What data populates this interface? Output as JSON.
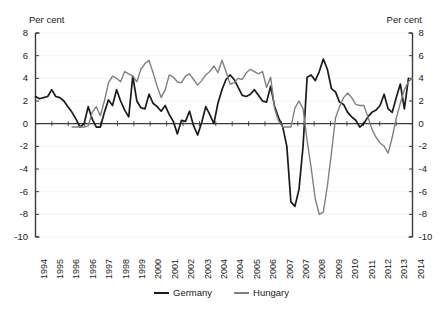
{
  "chart_data": {
    "type": "line",
    "title": "",
    "subtitle": "",
    "xlabel": "",
    "ylabel": "Per cent",
    "ylabel_right": "Per cent",
    "ylim": [
      -10,
      8
    ],
    "yticks": [
      8,
      6,
      4,
      2,
      0,
      -2,
      -4,
      -6,
      -8,
      -10
    ],
    "ytick_labels": [
      "8",
      "6",
      "4",
      "2",
      "0",
      "-2",
      "-4",
      "-6",
      "-8",
      "-10"
    ],
    "grid": true,
    "grid_axis": "y",
    "legend_position": "bottom",
    "zero_line": true,
    "dual_axis": true,
    "x_tick_labels": [
      "1994",
      "1995",
      "1996",
      "1996",
      "1997",
      "1998",
      "1999",
      "2000",
      "2001",
      "2002",
      "2003",
      "2004",
      "2004",
      "2005",
      "2006",
      "2007",
      "2007",
      "2008",
      "2009",
      "2010",
      "2011",
      "2012",
      "2013",
      "2014"
    ],
    "x_label_rotation": -90,
    "x_points_per_label": 3.6,
    "series": [
      {
        "name": "Germany",
        "color": "#1a1a1a",
        "values": [
          2.4,
          2.2,
          2.3,
          2.4,
          3.0,
          2.4,
          2.3,
          2.0,
          1.5,
          1.0,
          0.4,
          -0.3,
          0.0,
          1.5,
          0.4,
          -0.3,
          -0.3,
          1.0,
          2.1,
          1.6,
          3.0,
          2.0,
          1.2,
          0.6,
          4.2,
          2.0,
          1.4,
          1.3,
          2.6,
          1.8,
          1.5,
          1.1,
          1.6,
          0.8,
          0.2,
          -0.9,
          0.3,
          0.2,
          1.1,
          -0.2,
          -1.0,
          0.1,
          1.5,
          0.8,
          0.0,
          1.8,
          3.0,
          3.9,
          4.3,
          3.9,
          3.2,
          2.5,
          2.4,
          2.6,
          3.0,
          2.5,
          2.0,
          1.9,
          3.3,
          1.5,
          0.5,
          -0.3,
          -2.0,
          -6.9,
          -7.3,
          -5.8,
          -2.0,
          4.1,
          4.3,
          3.8,
          4.6,
          5.7,
          4.8,
          3.1,
          2.8,
          1.9,
          1.7,
          1.0,
          0.6,
          0.3,
          -0.3,
          0.0,
          0.6,
          1.0,
          1.2,
          1.6,
          2.6,
          1.3,
          1.0,
          2.3,
          3.5,
          1.3,
          4.0
        ]
      },
      {
        "name": "Hungary",
        "color": "#808080",
        "values": [
          null,
          null,
          null,
          null,
          null,
          null,
          null,
          null,
          null,
          -0.3,
          -0.3,
          -0.3,
          -0.3,
          -0.2,
          1.0,
          1.5,
          0.7,
          2.0,
          3.6,
          4.2,
          4.0,
          3.7,
          4.6,
          4.4,
          4.2,
          3.7,
          4.8,
          5.3,
          5.6,
          4.5,
          3.3,
          2.3,
          3.0,
          4.3,
          4.1,
          3.7,
          3.6,
          4.2,
          4.4,
          3.9,
          3.4,
          3.8,
          4.3,
          4.6,
          5.1,
          4.5,
          5.6,
          4.6,
          3.5,
          3.6,
          4.0,
          3.9,
          4.5,
          4.8,
          4.6,
          4.4,
          4.6,
          3.2,
          4.1,
          1.3,
          0.2,
          -0.3,
          -0.3,
          -0.3,
          1.4,
          2.0,
          1.3,
          -1.5,
          -3.9,
          -6.6,
          -8.0,
          -7.8,
          -5.5,
          -2.6,
          0.5,
          1.5,
          2.3,
          2.7,
          2.3,
          1.7,
          1.6,
          1.6,
          0.6,
          -0.5,
          -1.2,
          -1.7,
          -2.0,
          -2.6,
          -1.2,
          0.5,
          1.8,
          3.0,
          3.7,
          4.0
        ]
      }
    ]
  },
  "legend": {
    "items": [
      {
        "label": "Germany",
        "color": "#1a1a1a"
      },
      {
        "label": "Hungary",
        "color": "#808080"
      }
    ]
  }
}
